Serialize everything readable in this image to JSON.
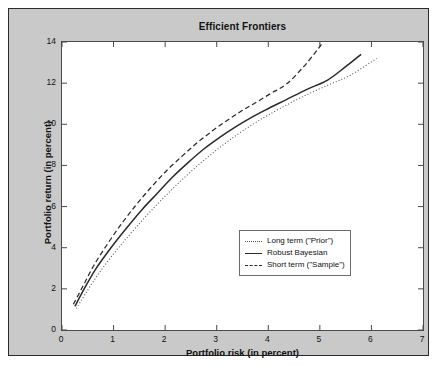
{
  "chart_data": {
    "type": "line",
    "title": "Efficient Frontiers",
    "xlabel": "Portfolio risk (in percent)",
    "ylabel": "Portfolio return (in percent)",
    "xlim": [
      0,
      7
    ],
    "ylim": [
      0,
      14
    ],
    "xticks": [
      0,
      1,
      2,
      3,
      4,
      5,
      6,
      7
    ],
    "yticks": [
      0,
      2,
      4,
      6,
      8,
      10,
      12,
      14
    ],
    "grid": false,
    "legend_position": "lower right",
    "series": [
      {
        "name": "Long term (\"Prior\")",
        "style": "dotted",
        "color": "#555555",
        "x": [
          0.28,
          0.45,
          0.7,
          1.0,
          1.3,
          1.6,
          1.9,
          2.2,
          2.5,
          2.8,
          3.1,
          3.4,
          3.7,
          4.0,
          4.4,
          4.8,
          5.2,
          5.6,
          6.1
        ],
        "y": [
          1.05,
          1.75,
          2.7,
          3.7,
          4.6,
          5.45,
          6.25,
          7.0,
          7.7,
          8.35,
          8.95,
          9.5,
          10.0,
          10.45,
          11.0,
          11.5,
          11.95,
          12.4,
          13.2
        ]
      },
      {
        "name": "Robust Bayesian",
        "style": "solid",
        "color": "#2a2a2a",
        "x": [
          0.25,
          0.42,
          0.65,
          0.95,
          1.25,
          1.55,
          1.85,
          2.15,
          2.45,
          2.75,
          3.05,
          3.35,
          3.65,
          3.95,
          4.35,
          4.75,
          5.15,
          5.5,
          5.8
        ],
        "y": [
          1.15,
          1.95,
          2.95,
          4.0,
          4.95,
          5.85,
          6.65,
          7.45,
          8.15,
          8.8,
          9.35,
          9.85,
          10.3,
          10.7,
          11.2,
          11.7,
          12.15,
          12.8,
          13.4
        ]
      },
      {
        "name": "Short term (\"Sample\")",
        "style": "dashed",
        "color": "#2a2a2a",
        "x": [
          0.22,
          0.4,
          0.62,
          0.9,
          1.18,
          1.46,
          1.75,
          2.05,
          2.35,
          2.62,
          2.9,
          3.18,
          3.45,
          3.72,
          4.05,
          4.35,
          4.65,
          4.9,
          5.05
        ],
        "y": [
          1.25,
          2.1,
          3.15,
          4.25,
          5.25,
          6.15,
          7.0,
          7.8,
          8.5,
          9.1,
          9.65,
          10.15,
          10.6,
          11.0,
          11.5,
          11.95,
          12.7,
          13.45,
          13.95
        ]
      }
    ]
  },
  "legend": {
    "entries": [
      {
        "label": "Long term (\"Prior\")"
      },
      {
        "label": "Robust Bayesian"
      },
      {
        "label": "Short term (\"Sample\")"
      }
    ]
  }
}
